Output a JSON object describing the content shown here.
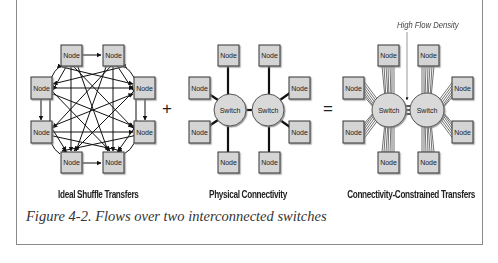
{
  "figure": {
    "caption": "Figure 4-2. Flows over two interconnected switches",
    "operators": {
      "plus": "+",
      "equals": "="
    },
    "panels": [
      {
        "title": "Ideal Shuffle Transfers",
        "node_label": "Node",
        "node_count": 8
      },
      {
        "title": "Physical Connectivity",
        "node_label": "Node",
        "switch_label": "Switch",
        "node_count": 8,
        "switch_count": 2
      },
      {
        "title": "Connectivity-Constrained Transfers",
        "node_label": "Node",
        "switch_label": "Switch",
        "annotation": "High Flow Density",
        "node_count": 8,
        "switch_count": 2
      }
    ],
    "colors": {
      "node_fill": "#d4d4d4",
      "switch_fill": "#d9d9d9",
      "stroke": "#1a1a1a",
      "frame": "#8a8a8a"
    }
  }
}
